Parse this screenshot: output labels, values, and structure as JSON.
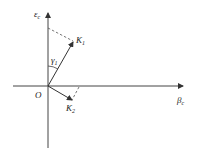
{
  "diagram": {
    "type": "vector-diagram",
    "axes": {
      "vertical": {
        "label": "ε",
        "subscript": "c"
      },
      "horizontal": {
        "label": "β",
        "subscript": "c"
      }
    },
    "origin": {
      "label": "O"
    },
    "vectors": [
      {
        "label": "K",
        "subscript": "1"
      },
      {
        "label": "K",
        "subscript": "2"
      }
    ],
    "angle": {
      "label": "γ",
      "subscript": "1"
    },
    "colors": {
      "line": "#333333",
      "background": "#ffffff"
    }
  }
}
